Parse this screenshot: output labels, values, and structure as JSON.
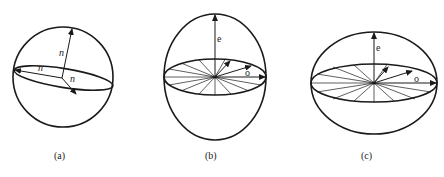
{
  "figure": {
    "panels": [
      {
        "id": "a",
        "caption": "(a)",
        "shape": "sphere",
        "radius_labels": [
          "n",
          "n",
          "n"
        ]
      },
      {
        "id": "b",
        "caption": "(b)",
        "shape": "prolate-ellipsoid",
        "axis_label_e": "e",
        "axis_label_o": "o"
      },
      {
        "id": "c",
        "caption": "(c)",
        "shape": "oblate-ellipsoid",
        "axis_label_e": "e",
        "axis_label_o": "o"
      }
    ],
    "colors": {
      "line": "#1a1a1a",
      "background": "#ffffff"
    }
  }
}
